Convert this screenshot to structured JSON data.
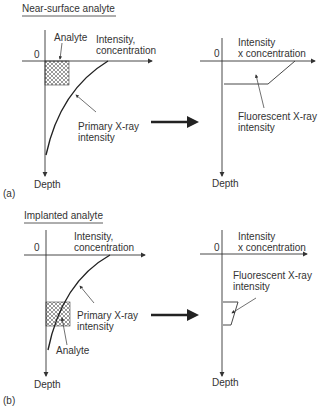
{
  "panel_a": {
    "title": "Near-surface analyte",
    "tag": "(a)",
    "left": {
      "origin": "0",
      "x_axis_line1": "Intensity,",
      "x_axis_line2": "concentration",
      "y_axis": "Depth",
      "analyte_label": "Analyte",
      "curve_label_line1": "Primary X-ray",
      "curve_label_line2": "intensity"
    },
    "right": {
      "origin": "0",
      "x_axis_line1": "Intensity",
      "x_axis_line2": "x concentration",
      "y_axis": "Depth",
      "curve_label_line1": "Fluorescent X-ray",
      "curve_label_line2": "intensity"
    }
  },
  "panel_b": {
    "title": "Implanted analyte",
    "tag": "(b)",
    "left": {
      "origin": "0",
      "x_axis_line1": "Intensity,",
      "x_axis_line2": "concentration",
      "y_axis": "Depth",
      "analyte_label": "Analyte",
      "curve_label_line1": "Primary X-ray",
      "curve_label_line2": "intensity"
    },
    "right": {
      "origin": "0",
      "x_axis_line1": "Intensity",
      "x_axis_line2": "x concentration",
      "y_axis": "Depth",
      "curve_label_line1": "Fluorescent X-ray",
      "curve_label_line2": "intensity"
    }
  },
  "colors": {
    "line": "#333333",
    "arrow": "#222222",
    "background": "#ffffff"
  }
}
